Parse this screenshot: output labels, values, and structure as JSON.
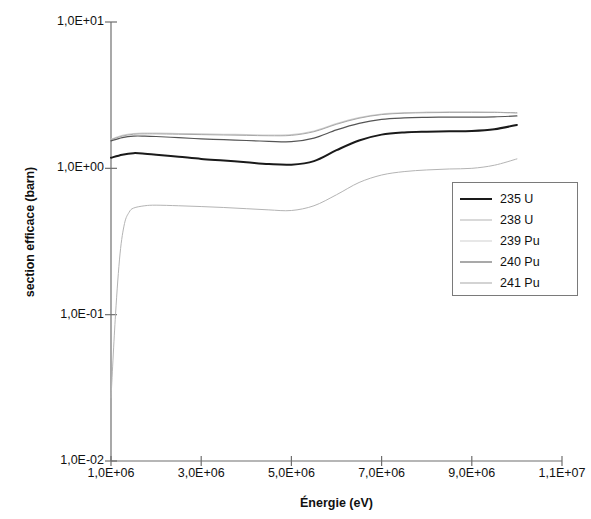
{
  "chart_data": {
    "type": "line",
    "title": "",
    "xlabel": "Énergie (eV)",
    "ylabel": "section efficace (barn)",
    "xscale": "linear",
    "yscale": "log",
    "xlim": [
      1000000,
      11000000
    ],
    "ylim": [
      0.01,
      10
    ],
    "grid": false,
    "legend_position": "center-right",
    "xticks": [
      {
        "value": 1000000,
        "label": "1,0E+06"
      },
      {
        "value": 3000000,
        "label": "3,0E+06"
      },
      {
        "value": 5000000,
        "label": "5,0E+06"
      },
      {
        "value": 7000000,
        "label": "7,0E+06"
      },
      {
        "value": 9000000,
        "label": "9,0E+06"
      },
      {
        "value": 11000000,
        "label": "1,1E+07"
      }
    ],
    "yticks": [
      {
        "value": 10,
        "label": "1,0E+01"
      },
      {
        "value": 1,
        "label": "1,0E+00"
      },
      {
        "value": 0.1,
        "label": "1,0E-01"
      },
      {
        "value": 0.01,
        "label": "1,0E-02"
      }
    ],
    "series": [
      {
        "name": "235 U",
        "color": "#1a1a1a",
        "width": 2.0,
        "dash": "none",
        "x": [
          1000000,
          1250000,
          1500000,
          1750000,
          2000000,
          2500000,
          3000000,
          3500000,
          4000000,
          4500000,
          5000000,
          5500000,
          6000000,
          6500000,
          7000000,
          7500000,
          8000000,
          8500000,
          9000000,
          9500000,
          10000000
        ],
        "y": [
          1.18,
          1.24,
          1.27,
          1.26,
          1.24,
          1.2,
          1.16,
          1.13,
          1.1,
          1.07,
          1.06,
          1.12,
          1.33,
          1.55,
          1.7,
          1.76,
          1.78,
          1.79,
          1.8,
          1.85,
          1.98
        ]
      },
      {
        "name": "238 U",
        "color": "#b4b4b4",
        "width": 1.0,
        "dash": "none",
        "x": [
          1000000,
          1100000,
          1200000,
          1300000,
          1400000,
          1500000,
          1750000,
          2000000,
          2500000,
          3000000,
          3500000,
          4000000,
          4500000,
          5000000,
          5500000,
          6000000,
          6500000,
          7000000,
          7500000,
          8000000,
          8500000,
          9000000,
          9500000,
          10000000
        ],
        "y": [
          0.027,
          0.1,
          0.26,
          0.42,
          0.5,
          0.535,
          0.555,
          0.56,
          0.555,
          0.548,
          0.54,
          0.53,
          0.52,
          0.515,
          0.555,
          0.66,
          0.8,
          0.9,
          0.95,
          0.975,
          0.99,
          1.0,
          1.05,
          1.16
        ]
      },
      {
        "name": "239 Pu",
        "color": "#cfcfcf",
        "width": 1.2,
        "dash": "none",
        "x": [
          1000000,
          1250000,
          1500000,
          1750000,
          2000000,
          2500000,
          3000000,
          3500000,
          4000000,
          4500000,
          5000000,
          5500000,
          6000000,
          6500000,
          7000000,
          7500000,
          8000000,
          8500000,
          9000000,
          9500000,
          10000000
        ],
        "y": [
          1.58,
          1.68,
          1.73,
          1.74,
          1.74,
          1.73,
          1.72,
          1.71,
          1.7,
          1.69,
          1.7,
          1.8,
          2.02,
          2.22,
          2.35,
          2.4,
          2.42,
          2.43,
          2.43,
          2.42,
          2.38
        ]
      },
      {
        "name": "240 Pu",
        "color": "#555555",
        "width": 1.2,
        "dash": "none",
        "x": [
          1000000,
          1250000,
          1500000,
          1750000,
          2000000,
          2500000,
          3000000,
          3500000,
          4000000,
          4500000,
          5000000,
          5500000,
          6000000,
          6500000,
          7000000,
          7500000,
          8000000,
          8500000,
          9000000,
          9500000,
          10000000
        ],
        "y": [
          1.54,
          1.62,
          1.66,
          1.66,
          1.65,
          1.62,
          1.59,
          1.57,
          1.55,
          1.53,
          1.52,
          1.61,
          1.83,
          2.03,
          2.16,
          2.21,
          2.23,
          2.24,
          2.24,
          2.25,
          2.28
        ]
      },
      {
        "name": "241 Pu",
        "color": "#a8a8a8",
        "width": 1.0,
        "dash": "none",
        "x": [
          1000000,
          1250000,
          1500000,
          1750000,
          2000000,
          2500000,
          3000000,
          3500000,
          4000000,
          4500000,
          5000000,
          5500000,
          6000000,
          6500000,
          7000000,
          7500000,
          8000000,
          8500000,
          9000000,
          9500000,
          10000000
        ],
        "y": [
          1.57,
          1.66,
          1.71,
          1.72,
          1.72,
          1.71,
          1.7,
          1.69,
          1.68,
          1.67,
          1.68,
          1.78,
          2.0,
          2.2,
          2.33,
          2.38,
          2.4,
          2.41,
          2.41,
          2.41,
          2.4
        ]
      }
    ]
  },
  "legend": {
    "items": [
      {
        "label": "235 U"
      },
      {
        "label": "238 U"
      },
      {
        "label": "239 Pu"
      },
      {
        "label": "240 Pu"
      },
      {
        "label": "241 Pu"
      }
    ]
  },
  "axis_color": "#6f6f6f"
}
